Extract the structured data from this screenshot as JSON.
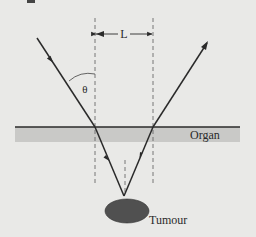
{
  "diagram": {
    "labels": {
      "distance": "L",
      "angle": "θ",
      "layer": "Organ",
      "target": "Tumour"
    },
    "colors": {
      "background": "#e9e9e7",
      "organ_band": "#c9c9c7",
      "lines": "#2a2a2a",
      "tumour": "#505050",
      "dashed": "#6a6a6a"
    }
  }
}
